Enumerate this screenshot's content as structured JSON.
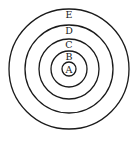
{
  "diagram": {
    "type": "concentric-circles",
    "center": {
      "x": 69,
      "y": 69
    },
    "stroke_color": "#1a1a1a",
    "background": "#ffffff",
    "rings": [
      {
        "label": "A",
        "r": 7,
        "label_y": 73
      },
      {
        "label": "B",
        "r": 18,
        "label_y": 60
      },
      {
        "label": "C",
        "r": 30,
        "label_y": 48
      },
      {
        "label": "D",
        "r": 44,
        "label_y": 34
      },
      {
        "label": "E",
        "r": 60,
        "label_y": 18
      }
    ]
  }
}
